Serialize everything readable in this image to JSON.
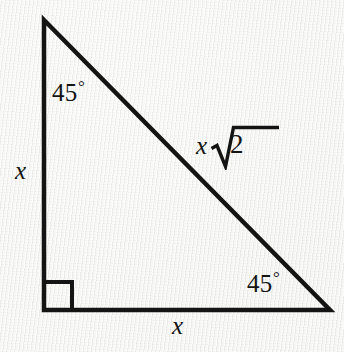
{
  "figure": {
    "shape": "right triangle",
    "background_color": "#f3f3f1",
    "stroke_color": "#141414"
  },
  "geometry": {
    "vertices": {
      "apex": {
        "x": 44,
        "y": 20
      },
      "right_angle": {
        "x": 44,
        "y": 310
      },
      "bottom_right": {
        "x": 330,
        "y": 310
      }
    },
    "right_angle_marker": {
      "x": 44,
      "y": 282,
      "size": 28
    }
  },
  "labels": {
    "angle_top": {
      "value": "45",
      "degree": "°"
    },
    "angle_bottom_right": {
      "value": "45",
      "degree": "°"
    },
    "leg_vertical": "x",
    "leg_horizontal": "x",
    "hypotenuse_coefficient": "x",
    "hypotenuse_radicand": "2"
  }
}
